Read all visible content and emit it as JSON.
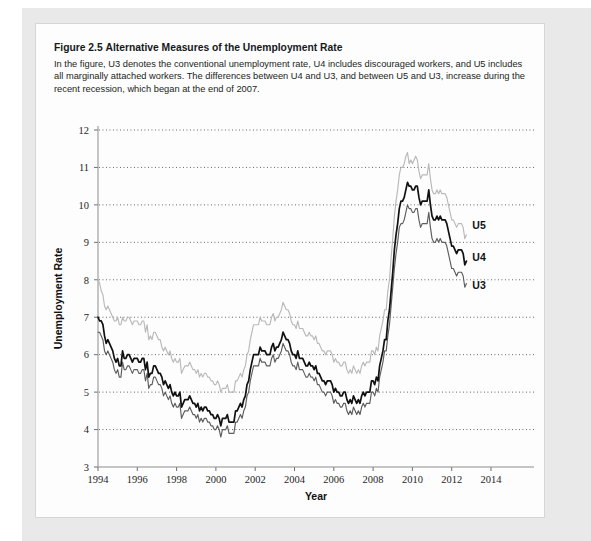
{
  "caption": {
    "figure_number": "Figure 2.5",
    "title": "Alternative Measures of the Unemployment Rate",
    "body": "In the figure, U3 denotes the conventional unemployment rate, U4 includes discouraged workers, and U5 includes all marginally attached workers. The differences between U4 and U3, and between U5 and U3, increase during the recent recession, which began at the end of 2007."
  },
  "chart_data": {
    "type": "line",
    "title": "Alternative Measures of the Unemployment Rate",
    "xlabel": "Year",
    "ylabel": "Unemployment Rate",
    "xlim": [
      1994,
      2014
    ],
    "ylim": [
      3,
      12
    ],
    "xticks": [
      1994,
      1996,
      1998,
      2000,
      2002,
      2004,
      2006,
      2008,
      2010,
      2012,
      2014
    ],
    "xticklabels": [
      "1994",
      "1996",
      "1998",
      "2000",
      "2002",
      "2004",
      "2006",
      "2008",
      "2010",
      "2012",
      "2014"
    ],
    "yticks": [
      3,
      4,
      5,
      6,
      7,
      8,
      9,
      10,
      11,
      12
    ],
    "yticklabels": [
      "3",
      "4",
      "5",
      "6",
      "7",
      "8",
      "9",
      "10",
      "11",
      "12"
    ],
    "grid": "horizontal-dotted",
    "legend_position": "inline-right-of-lines",
    "colors": {
      "U3": "#5d5d5d",
      "U4": "#111111",
      "U5": "#b9b9b9"
    },
    "x": [
      1994.0,
      1994.083,
      1994.167,
      1994.25,
      1994.333,
      1994.417,
      1994.5,
      1994.583,
      1994.667,
      1994.75,
      1994.833,
      1994.917,
      1995.0,
      1995.083,
      1995.167,
      1995.25,
      1995.333,
      1995.417,
      1995.5,
      1995.583,
      1995.667,
      1995.75,
      1995.833,
      1995.917,
      1996.0,
      1996.083,
      1996.167,
      1996.25,
      1996.333,
      1996.417,
      1996.5,
      1996.583,
      1996.667,
      1996.75,
      1996.833,
      1996.917,
      1997.0,
      1997.083,
      1997.167,
      1997.25,
      1997.333,
      1997.417,
      1997.5,
      1997.583,
      1997.667,
      1997.75,
      1997.833,
      1997.917,
      1998.0,
      1998.083,
      1998.167,
      1998.25,
      1998.333,
      1998.417,
      1998.5,
      1998.583,
      1998.667,
      1998.75,
      1998.833,
      1998.917,
      1999.0,
      1999.083,
      1999.167,
      1999.25,
      1999.333,
      1999.417,
      1999.5,
      1999.583,
      1999.667,
      1999.75,
      1999.833,
      1999.917,
      2000.0,
      2000.083,
      2000.167,
      2000.25,
      2000.333,
      2000.417,
      2000.5,
      2000.583,
      2000.667,
      2000.75,
      2000.833,
      2000.917,
      2001.0,
      2001.083,
      2001.167,
      2001.25,
      2001.333,
      2001.417,
      2001.5,
      2001.583,
      2001.667,
      2001.75,
      2001.833,
      2001.917,
      2002.0,
      2002.083,
      2002.167,
      2002.25,
      2002.333,
      2002.417,
      2002.5,
      2002.583,
      2002.667,
      2002.75,
      2002.833,
      2002.917,
      2003.0,
      2003.083,
      2003.167,
      2003.25,
      2003.333,
      2003.417,
      2003.5,
      2003.583,
      2003.667,
      2003.75,
      2003.833,
      2003.917,
      2004.0,
      2004.083,
      2004.167,
      2004.25,
      2004.333,
      2004.417,
      2004.5,
      2004.583,
      2004.667,
      2004.75,
      2004.833,
      2004.917,
      2005.0,
      2005.083,
      2005.167,
      2005.25,
      2005.333,
      2005.417,
      2005.5,
      2005.583,
      2005.667,
      2005.75,
      2005.833,
      2005.917,
      2006.0,
      2006.083,
      2006.167,
      2006.25,
      2006.333,
      2006.417,
      2006.5,
      2006.583,
      2006.667,
      2006.75,
      2006.833,
      2006.917,
      2007.0,
      2007.083,
      2007.167,
      2007.25,
      2007.333,
      2007.417,
      2007.5,
      2007.583,
      2007.667,
      2007.75,
      2007.833,
      2007.917,
      2008.0,
      2008.083,
      2008.167,
      2008.25,
      2008.333,
      2008.417,
      2008.5,
      2008.583,
      2008.667,
      2008.75,
      2008.833,
      2008.917,
      2009.0,
      2009.083,
      2009.167,
      2009.25,
      2009.333,
      2009.417,
      2009.5,
      2009.583,
      2009.667,
      2009.75,
      2009.833,
      2009.917,
      2010.0,
      2010.083,
      2010.167,
      2010.25,
      2010.333,
      2010.417,
      2010.5,
      2010.583,
      2010.667,
      2010.75,
      2010.833,
      2010.917,
      2011.0,
      2011.083,
      2011.167,
      2011.25,
      2011.333,
      2011.417,
      2011.5,
      2011.583,
      2011.667,
      2011.75,
      2011.833,
      2011.917,
      2012.0,
      2012.083,
      2012.167,
      2012.25,
      2012.333,
      2012.417,
      2012.5,
      2012.583,
      2012.667,
      2012.75
    ],
    "series": [
      {
        "name": "U3",
        "label": "U3",
        "color": "#5d5d5d",
        "values": [
          6.6,
          6.6,
          6.5,
          6.4,
          6.1,
          6.0,
          6.1,
          6.0,
          5.9,
          5.8,
          5.6,
          5.5,
          5.6,
          5.4,
          5.4,
          5.8,
          5.6,
          5.6,
          5.7,
          5.7,
          5.6,
          5.5,
          5.6,
          5.6,
          5.6,
          5.5,
          5.5,
          5.6,
          5.6,
          5.3,
          5.5,
          5.1,
          5.2,
          5.2,
          5.4,
          5.4,
          5.3,
          5.2,
          5.2,
          5.1,
          4.9,
          5.0,
          4.9,
          4.8,
          4.9,
          4.7,
          4.6,
          4.7,
          4.6,
          4.6,
          4.7,
          4.3,
          4.4,
          4.5,
          4.5,
          4.5,
          4.6,
          4.5,
          4.4,
          4.4,
          4.3,
          4.4,
          4.2,
          4.3,
          4.2,
          4.3,
          4.3,
          4.2,
          4.2,
          4.1,
          4.1,
          4.0,
          4.0,
          4.1,
          4.0,
          3.8,
          4.0,
          4.0,
          4.0,
          4.1,
          3.9,
          3.9,
          3.9,
          3.9,
          4.2,
          4.2,
          4.3,
          4.4,
          4.3,
          4.5,
          4.6,
          4.9,
          5.0,
          5.3,
          5.5,
          5.7,
          5.7,
          5.7,
          5.7,
          5.9,
          5.8,
          5.8,
          5.8,
          5.7,
          5.7,
          5.7,
          5.9,
          6.0,
          5.8,
          5.9,
          5.9,
          6.0,
          6.1,
          6.3,
          6.2,
          6.1,
          6.1,
          6.0,
          5.8,
          5.7,
          5.7,
          5.6,
          5.8,
          5.6,
          5.6,
          5.6,
          5.5,
          5.4,
          5.4,
          5.5,
          5.4,
          5.4,
          5.3,
          5.4,
          5.2,
          5.2,
          5.1,
          5.0,
          5.0,
          4.9,
          5.0,
          5.0,
          5.0,
          4.9,
          4.7,
          4.8,
          4.7,
          4.7,
          4.6,
          4.6,
          4.7,
          4.7,
          4.5,
          4.4,
          4.5,
          4.4,
          4.6,
          4.5,
          4.4,
          4.5,
          4.4,
          4.6,
          4.7,
          4.6,
          4.7,
          4.7,
          4.7,
          5.0,
          5.0,
          4.9,
          5.1,
          5.0,
          5.4,
          5.6,
          5.8,
          6.1,
          6.1,
          6.5,
          6.8,
          7.3,
          7.8,
          8.3,
          8.7,
          9.0,
          9.4,
          9.5,
          9.5,
          9.6,
          9.8,
          10.0,
          9.9,
          9.9,
          9.8,
          9.8,
          9.9,
          9.9,
          9.6,
          9.4,
          9.5,
          9.5,
          9.5,
          9.5,
          9.8,
          9.4,
          9.1,
          9.0,
          9.0,
          9.1,
          9.0,
          9.1,
          9.0,
          9.0,
          9.0,
          8.9,
          8.7,
          8.5,
          8.3,
          8.3,
          8.2,
          8.1,
          8.2,
          8.2,
          8.2,
          8.1,
          7.8,
          7.9
        ]
      },
      {
        "name": "U4",
        "label": "U4",
        "color": "#111111",
        "values": [
          7.0,
          6.9,
          6.9,
          6.8,
          6.5,
          6.3,
          6.4,
          6.3,
          6.2,
          6.1,
          5.9,
          5.8,
          5.9,
          5.7,
          5.7,
          6.1,
          5.9,
          5.9,
          6.0,
          6.0,
          5.9,
          5.8,
          5.9,
          5.9,
          5.9,
          5.8,
          5.8,
          5.9,
          5.9,
          5.6,
          5.8,
          5.4,
          5.5,
          5.5,
          5.7,
          5.7,
          5.6,
          5.5,
          5.5,
          5.4,
          5.2,
          5.3,
          5.2,
          5.1,
          5.2,
          5.0,
          4.9,
          5.0,
          4.9,
          4.9,
          5.0,
          4.6,
          4.7,
          4.8,
          4.8,
          4.8,
          4.9,
          4.8,
          4.7,
          4.7,
          4.6,
          4.7,
          4.5,
          4.6,
          4.5,
          4.6,
          4.6,
          4.5,
          4.5,
          4.4,
          4.4,
          4.3,
          4.3,
          4.4,
          4.3,
          4.1,
          4.3,
          4.3,
          4.3,
          4.4,
          4.2,
          4.2,
          4.2,
          4.2,
          4.5,
          4.5,
          4.6,
          4.7,
          4.6,
          4.8,
          4.9,
          5.2,
          5.3,
          5.6,
          5.8,
          6.0,
          6.0,
          6.0,
          6.0,
          6.2,
          6.1,
          6.1,
          6.1,
          6.0,
          6.0,
          6.0,
          6.2,
          6.3,
          6.1,
          6.2,
          6.2,
          6.3,
          6.4,
          6.6,
          6.5,
          6.4,
          6.4,
          6.3,
          6.1,
          6.0,
          6.0,
          5.9,
          6.1,
          5.9,
          5.9,
          5.9,
          5.8,
          5.7,
          5.7,
          5.8,
          5.7,
          5.7,
          5.6,
          5.7,
          5.5,
          5.5,
          5.4,
          5.3,
          5.3,
          5.2,
          5.3,
          5.3,
          5.3,
          5.2,
          5.0,
          5.1,
          5.0,
          5.0,
          4.9,
          4.9,
          5.0,
          5.0,
          4.8,
          4.7,
          4.8,
          4.7,
          4.9,
          4.8,
          4.7,
          4.8,
          4.7,
          4.9,
          5.0,
          4.9,
          5.0,
          5.0,
          5.0,
          5.3,
          5.3,
          5.2,
          5.4,
          5.3,
          5.7,
          5.9,
          6.1,
          6.4,
          6.4,
          6.9,
          7.2,
          7.7,
          8.2,
          8.8,
          9.2,
          9.5,
          9.9,
          10.1,
          10.1,
          10.2,
          10.4,
          10.6,
          10.5,
          10.5,
          10.4,
          10.4,
          10.5,
          10.5,
          10.2,
          10.0,
          10.1,
          10.1,
          10.1,
          10.1,
          10.4,
          10.0,
          9.7,
          9.6,
          9.6,
          9.7,
          9.6,
          9.7,
          9.6,
          9.6,
          9.6,
          9.5,
          9.3,
          9.1,
          8.9,
          8.9,
          8.8,
          8.7,
          8.8,
          8.8,
          8.8,
          8.7,
          8.4,
          8.5
        ]
      },
      {
        "name": "U5",
        "label": "U5",
        "color": "#b9b9b9",
        "values": [
          8.0,
          7.9,
          7.7,
          7.6,
          7.3,
          7.2,
          7.3,
          7.2,
          7.1,
          7.0,
          6.9,
          6.9,
          7.0,
          6.8,
          6.8,
          7.0,
          6.9,
          6.9,
          7.0,
          7.0,
          6.9,
          6.8,
          6.9,
          6.9,
          6.9,
          6.8,
          6.8,
          6.9,
          6.9,
          6.6,
          6.8,
          6.4,
          6.5,
          6.4,
          6.6,
          6.6,
          6.5,
          6.4,
          6.4,
          6.2,
          6.1,
          6.2,
          6.1,
          6.0,
          6.1,
          5.9,
          5.8,
          5.9,
          5.8,
          5.8,
          5.9,
          5.5,
          5.6,
          5.7,
          5.7,
          5.7,
          5.8,
          5.7,
          5.6,
          5.6,
          5.5,
          5.6,
          5.4,
          5.5,
          5.4,
          5.5,
          5.5,
          5.4,
          5.4,
          5.3,
          5.3,
          5.2,
          5.2,
          5.3,
          5.2,
          5.0,
          5.1,
          5.1,
          5.1,
          5.2,
          5.0,
          5.0,
          5.0,
          5.0,
          5.3,
          5.3,
          5.4,
          5.5,
          5.4,
          5.6,
          5.7,
          6.0,
          6.1,
          6.4,
          6.6,
          6.8,
          6.8,
          6.8,
          6.8,
          7.0,
          6.9,
          6.9,
          6.9,
          6.8,
          6.8,
          6.8,
          7.0,
          7.1,
          6.9,
          7.0,
          7.0,
          7.1,
          7.2,
          7.4,
          7.3,
          7.2,
          7.2,
          7.1,
          6.9,
          6.8,
          6.8,
          6.7,
          6.9,
          6.7,
          6.7,
          6.7,
          6.6,
          6.5,
          6.5,
          6.6,
          6.5,
          6.5,
          6.4,
          6.5,
          6.3,
          6.3,
          6.2,
          6.1,
          6.1,
          6.0,
          6.1,
          6.1,
          6.1,
          6.0,
          5.8,
          5.9,
          5.8,
          5.8,
          5.7,
          5.7,
          5.8,
          5.8,
          5.6,
          5.5,
          5.6,
          5.5,
          5.7,
          5.6,
          5.5,
          5.6,
          5.5,
          5.7,
          5.8,
          5.7,
          5.8,
          5.8,
          5.8,
          6.1,
          6.1,
          6.0,
          6.2,
          6.1,
          6.5,
          6.7,
          6.9,
          7.2,
          7.2,
          7.7,
          8.0,
          8.6,
          9.1,
          9.7,
          10.1,
          10.4,
          10.8,
          11.0,
          11.0,
          11.1,
          11.3,
          11.4,
          11.1,
          11.2,
          11.1,
          11.2,
          11.3,
          11.2,
          10.9,
          10.7,
          10.8,
          10.8,
          10.8,
          10.8,
          11.1,
          10.7,
          10.4,
          10.3,
          10.3,
          10.4,
          10.3,
          10.4,
          10.3,
          10.3,
          10.3,
          10.2,
          10.0,
          9.8,
          9.6,
          9.6,
          9.5,
          9.4,
          9.5,
          9.5,
          9.5,
          9.4,
          9.1,
          9.2
        ]
      }
    ],
    "inline_labels": [
      {
        "text": "U5",
        "x": 2013.05,
        "y": 9.45
      },
      {
        "text": "U4",
        "x": 2013.05,
        "y": 8.62
      },
      {
        "text": "U3",
        "x": 2013.05,
        "y": 7.85
      }
    ]
  }
}
